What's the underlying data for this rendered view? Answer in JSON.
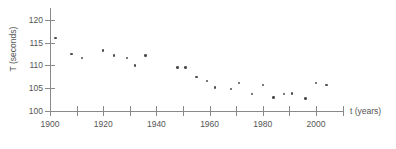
{
  "chart_data": {
    "type": "scatter",
    "title": "",
    "xlabel": "t (years)",
    "ylabel": "T (seconds)",
    "xlim": [
      1900,
      2010
    ],
    "ylim": [
      100,
      121
    ],
    "grid": false,
    "legend": "none",
    "marker_color": "#4d4d4d",
    "axis_color": "#8a8a8a",
    "x_ticks": [
      1900,
      1910,
      1920,
      1930,
      1940,
      1950,
      1960,
      1970,
      1980,
      1990,
      2000,
      2010
    ],
    "x_tick_labels": [
      "1900",
      "",
      "1920",
      "",
      "1940",
      "",
      "1960",
      "",
      "1980",
      "",
      "2000",
      ""
    ],
    "y_ticks": [
      100,
      105,
      110,
      115,
      120
    ],
    "y_tick_labels": [
      "100",
      "105",
      "110",
      "115",
      "120"
    ],
    "x": [
      1902,
      1908,
      1912,
      1920,
      1924,
      1929,
      1932,
      1936,
      1948,
      1951,
      1955,
      1959,
      1962,
      1968,
      1971,
      1976,
      1980,
      1984,
      1988,
      1991,
      1996,
      2000,
      2004
    ],
    "y": [
      116.0,
      112.5,
      111.6,
      113.3,
      112.2,
      111.6,
      110.0,
      112.2,
      109.6,
      109.6,
      107.5,
      106.6,
      105.2,
      104.8,
      106.1,
      103.7,
      105.7,
      103.0,
      103.7,
      103.8,
      102.7,
      106.1,
      105.7
    ],
    "points": [
      {
        "t": 1902,
        "T": 116.0
      },
      {
        "t": 1908,
        "T": 112.5
      },
      {
        "t": 1912,
        "T": 111.6
      },
      {
        "t": 1920,
        "T": 113.3
      },
      {
        "t": 1924,
        "T": 112.2
      },
      {
        "t": 1929,
        "T": 111.6
      },
      {
        "t": 1932,
        "T": 110.0
      },
      {
        "t": 1936,
        "T": 112.2
      },
      {
        "t": 1948,
        "T": 109.6
      },
      {
        "t": 1951,
        "T": 109.6
      },
      {
        "t": 1955,
        "T": 107.5
      },
      {
        "t": 1959,
        "T": 106.6
      },
      {
        "t": 1962,
        "T": 105.2
      },
      {
        "t": 1968,
        "T": 104.8
      },
      {
        "t": 1971,
        "T": 106.1
      },
      {
        "t": 1976,
        "T": 103.7
      },
      {
        "t": 1980,
        "T": 105.7
      },
      {
        "t": 1984,
        "T": 103.0
      },
      {
        "t": 1988,
        "T": 103.7
      },
      {
        "t": 1991,
        "T": 103.8
      },
      {
        "t": 1996,
        "T": 102.7
      },
      {
        "t": 2000,
        "T": 106.1
      },
      {
        "t": 2004,
        "T": 105.7
      }
    ]
  }
}
